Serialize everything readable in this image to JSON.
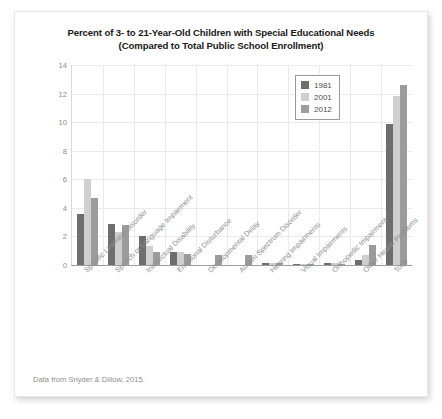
{
  "figure": {
    "title_line1": "Percent of 3- to 21-Year-Old Children with Special Educational Needs",
    "title_line2": "(Compared to Total Public School Enrollment)",
    "source_note": "Data from Snyder & Dillow, 2015."
  },
  "colors": {
    "series_1981": "#6e6e6e",
    "series_2001": "#cfcfcf",
    "series_2012": "#9c9c9c",
    "gridline": "#eaeaea",
    "axis": "#9e9e9e",
    "tick_text": "#8a8a8a",
    "title_text": "#1a1a1a",
    "card_background": "#ffffff"
  },
  "chart_data": {
    "type": "bar",
    "title": "Percent of 3- to 21-Year-Old Children with Special Educational Needs (Compared to Total Public School Enrollment)",
    "xlabel": "",
    "ylabel": "",
    "ylim": [
      0,
      14
    ],
    "yticks": [
      0,
      2,
      4,
      6,
      8,
      10,
      12,
      14
    ],
    "ytick_labels": [
      "0",
      "2",
      "4",
      "6",
      "8",
      "10",
      "12",
      "14"
    ],
    "grid": true,
    "legend_position": "upper center",
    "categories": [
      "Specific Learning Disorder",
      "Speech or Language Impairment",
      "Intellectual Disability",
      "Emotional Disturbance",
      "Developmental Delay",
      "Autism Spectrum Disorder",
      "Hearing Impairments",
      "Visual Impairments",
      "Orthopedic Impairment",
      "Other Health Problems",
      "Total"
    ],
    "series": [
      {
        "name": "1981",
        "color": "#6e6e6e",
        "values": [
          3.6,
          2.9,
          2.0,
          0.9,
          0.0,
          0.0,
          0.15,
          0.07,
          0.14,
          0.32,
          9.9
        ]
      },
      {
        "name": "2001",
        "color": "#cfcfcf",
        "values": [
          6.0,
          2.3,
          1.3,
          0.9,
          0.0,
          0.0,
          0.15,
          0.06,
          0.14,
          0.7,
          11.8
        ]
      },
      {
        "name": "2012",
        "color": "#9c9c9c",
        "values": [
          4.7,
          2.8,
          0.9,
          0.75,
          0.7,
          0.7,
          0.13,
          0.05,
          0.1,
          1.4,
          12.6
        ]
      }
    ]
  }
}
